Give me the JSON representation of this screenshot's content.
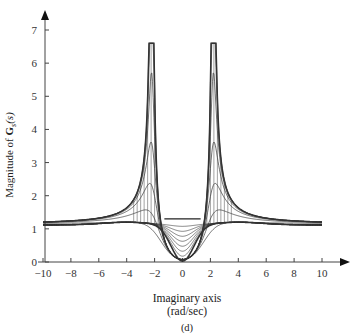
{
  "chart_data": {
    "type": "line",
    "subtype": "3d-surface-mesh-projection",
    "title": "",
    "panel_label": "(d)",
    "xlabel": "Imaginary axis",
    "xlabel_units": "(rad/sec)",
    "ylabel_prefix": "Magnitude of ",
    "ylabel_symbol": "G",
    "ylabel_subscript": "s",
    "ylabel_suffix": "(s)",
    "xlim": [
      -10,
      10
    ],
    "ylim": [
      0,
      7
    ],
    "xticks": [
      -10,
      -8,
      -6,
      -4,
      -2,
      0,
      2,
      4,
      6,
      8,
      10
    ],
    "yticks": [
      0,
      1,
      2,
      3,
      4,
      5,
      6,
      7
    ],
    "grid": false,
    "legend": null,
    "annotations": [
      "Resonant peaks near ±2.2 rad/sec reaching ~6.6",
      "Trough near 0 dipping to ~0.1"
    ],
    "series": [
      {
        "name": "outer envelope (peak curve)",
        "x": [
          -10,
          -8,
          -6,
          -4,
          -3,
          -2.6,
          -2.3,
          -2.2,
          -2.1,
          -1.8,
          -1.5,
          -1.3,
          1.3,
          1.5,
          1.8,
          2.1,
          2.2,
          2.3,
          2.6,
          3,
          4,
          6,
          8,
          10
        ],
        "values": [
          1.15,
          1.18,
          1.25,
          1.45,
          1.9,
          2.6,
          4.5,
          6.6,
          4.5,
          2.2,
          1.5,
          1.3,
          1.3,
          1.5,
          2.2,
          4.5,
          6.6,
          4.5,
          2.6,
          1.9,
          1.45,
          1.25,
          1.18,
          1.15
        ]
      },
      {
        "name": "lower envelope (trough curve)",
        "x": [
          -10,
          -8,
          -6,
          -4,
          -3,
          -2,
          -1.5,
          -1,
          -0.5,
          0,
          0.5,
          1,
          1.5,
          2,
          3,
          4,
          6,
          8,
          10
        ],
        "values": [
          1.12,
          1.13,
          1.15,
          1.18,
          1.15,
          0.95,
          0.6,
          0.3,
          0.14,
          0.1,
          0.14,
          0.3,
          0.6,
          0.95,
          1.15,
          1.18,
          1.15,
          1.13,
          1.1
        ]
      }
    ]
  }
}
